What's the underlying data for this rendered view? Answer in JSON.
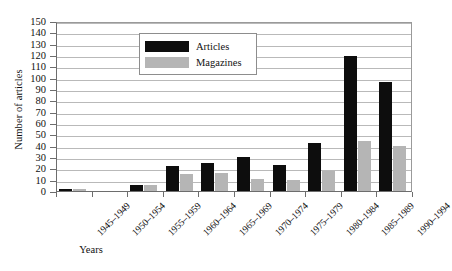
{
  "chart_data": {
    "type": "bar",
    "title": "",
    "xlabel": "Years",
    "ylabel": "Number of articles",
    "ylim": [
      0,
      150
    ],
    "ytick_step": 10,
    "grid": true,
    "legend_position": "top-center",
    "categories": [
      "1945–1949",
      "1950–1954",
      "1955–1959",
      "1960–1964",
      "1965–1969",
      "1970–1974",
      "1975–1979",
      "1980–1984",
      "1985–1989",
      "1990–1994"
    ],
    "yticks": [
      0,
      10,
      20,
      30,
      40,
      50,
      60,
      70,
      80,
      90,
      100,
      110,
      120,
      130,
      140,
      150
    ],
    "series": [
      {
        "name": "Articles",
        "color": "#0d0d0d",
        "values": [
          2,
          0,
          5,
          22,
          25,
          30,
          23,
          42,
          119,
          96
        ]
      },
      {
        "name": "Magazines",
        "color": "#b5b5b5",
        "values": [
          2,
          0,
          5,
          15,
          16,
          11,
          10,
          18,
          44,
          40
        ]
      }
    ]
  }
}
